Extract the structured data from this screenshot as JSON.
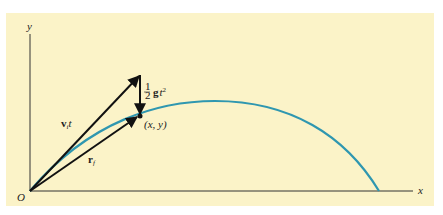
{
  "figure": {
    "panel_color": "#fbf3c8",
    "trajectory_color": "#2f97b0",
    "vector_color": "#111111",
    "axis_color": "#333333"
  },
  "axes": {
    "y_label": "y",
    "x_label": "x",
    "origin_label": "O"
  },
  "vectors": {
    "initial_velocity_label_main": "v",
    "initial_velocity_label_sub": "i",
    "initial_velocity_label_tail": "t",
    "gravity_label_frac_num": "1",
    "gravity_label_frac_den": "2",
    "gravity_label_main": "g",
    "gravity_label_tail": "t",
    "gravity_label_exp": "2",
    "position_label_main": "r",
    "position_label_sub": "f"
  },
  "point": {
    "label": "(x, y)"
  }
}
